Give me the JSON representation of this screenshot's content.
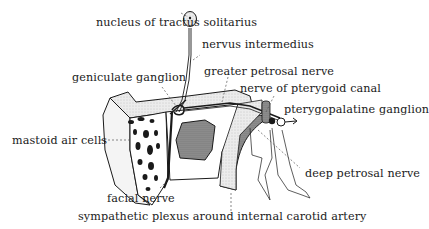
{
  "diagram": {
    "colors": {
      "ink": "#1a1a1a",
      "bone_fill": "#e6e6e6",
      "dark_fill": "#7a7a7a",
      "background": "#ffffff"
    },
    "labels": [
      {
        "id": "nucleus",
        "text": "nucleus of tractus solitarius"
      },
      {
        "id": "nervus_intermedius",
        "text": "nervus intermedius"
      },
      {
        "id": "geniculate",
        "text": "geniculate ganglion"
      },
      {
        "id": "greater_petrosal",
        "text": "greater petrosal nerve"
      },
      {
        "id": "pterygoid_canal",
        "text": "nerve of pterygoid canal"
      },
      {
        "id": "pterygopalatine",
        "text": "pterygopalatine ganglion"
      },
      {
        "id": "mastoid",
        "text": "mastoid air cells"
      },
      {
        "id": "deep_petrosal",
        "text": "deep petrosal nerve"
      },
      {
        "id": "facial",
        "text": "facial nerve"
      },
      {
        "id": "sympathetic",
        "text": "sympathetic plexus around internal carotid artery"
      }
    ]
  }
}
